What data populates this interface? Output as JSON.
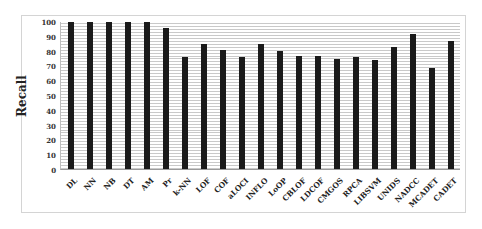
{
  "chart_data": {
    "type": "bar",
    "title": "",
    "xlabel": "",
    "ylabel": "Recall",
    "ylim": [
      0,
      100
    ],
    "yticks": [
      0,
      10,
      20,
      30,
      40,
      50,
      60,
      70,
      80,
      90,
      100
    ],
    "grid": true,
    "legend": null,
    "categories": [
      "DL",
      "NN",
      "NB",
      "DT",
      "AM",
      "Pr",
      "k-NN",
      "LOF",
      "COF",
      "aLOCI",
      "INFLO",
      "LoOP",
      "CBLOF",
      "LDCOF",
      "CMGOS",
      "RPCA",
      "LIBSVM",
      "UNIDS",
      "NADCC",
      "MCADET",
      "CADET"
    ],
    "values": [
      100,
      100,
      100,
      100,
      100,
      96,
      76,
      85,
      81,
      76,
      85,
      80,
      77,
      77,
      75,
      76,
      74,
      83,
      92,
      69,
      87
    ],
    "bar_color": "#1a1a1a"
  }
}
